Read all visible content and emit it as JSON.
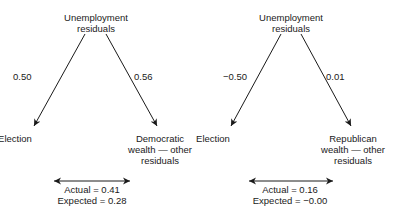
{
  "diagrams": [
    {
      "top_node": [
        "Unemployment",
        "residuals"
      ],
      "left_node": "Election",
      "right_node": [
        "Democratic",
        "wealth — other",
        "residuals"
      ],
      "left_coef": "0.50",
      "right_coef": "0.56",
      "actual": "Actual = 0.41",
      "expected": "Expected = 0.28"
    },
    {
      "top_node": [
        "Unemployment",
        "residuals"
      ],
      "left_node": "Election",
      "right_node": [
        "Republican",
        "wealth — other",
        "residuals"
      ],
      "left_coef": "−0.50",
      "right_coef": "0.01",
      "actual": "Actual = 0.16",
      "expected": "Expected = −0.00"
    }
  ]
}
